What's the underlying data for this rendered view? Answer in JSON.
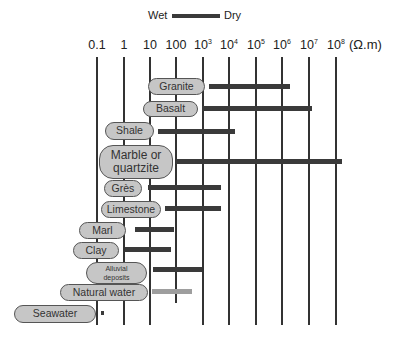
{
  "legend": {
    "wet_label": "Wet",
    "dry_label": "Dry",
    "swatch_color": "#3a3a3a"
  },
  "axis": {
    "unit": "(Ω.m)",
    "ticks": [
      {
        "base": "0.1",
        "exp": "",
        "x": 97
      },
      {
        "base": "1",
        "exp": "",
        "x": 124
      },
      {
        "base": "10",
        "exp": "",
        "x": 150
      },
      {
        "base": "100",
        "exp": "",
        "x": 176
      },
      {
        "base": "10",
        "exp": "3",
        "x": 203
      },
      {
        "base": "10",
        "exp": "4",
        "x": 229
      },
      {
        "base": "10",
        "exp": "5",
        "x": 256
      },
      {
        "base": "10",
        "exp": "6",
        "x": 282
      },
      {
        "base": "10",
        "exp": "7",
        "x": 309
      },
      {
        "base": "10",
        "exp": "8",
        "x": 336
      }
    ]
  },
  "materials": [
    {
      "name": "Granite",
      "line2": ""
    },
    {
      "name": "Basalt",
      "line2": ""
    },
    {
      "name": "Shale",
      "line2": ""
    },
    {
      "name": "Marble or",
      "line2": "quartzite"
    },
    {
      "name": "Grès",
      "line2": ""
    },
    {
      "name": "Limestone",
      "line2": ""
    },
    {
      "name": "Marl",
      "line2": ""
    },
    {
      "name": "Clay",
      "line2": ""
    },
    {
      "name": "Alluvial",
      "line2": "deposits"
    },
    {
      "name": "Natural water",
      "line2": ""
    },
    {
      "name": "Seawater",
      "line2": ""
    }
  ],
  "colors": {
    "bar": "#3a3a3a",
    "water_bar": "#9e9e9e",
    "pill_fill": "#c6c6c6",
    "pill_border": "#555555"
  },
  "chart_data": {
    "type": "bar",
    "subtype": "horizontal range (floating) bars on log scale",
    "title": "",
    "legend": [
      "Wet",
      "Dry"
    ],
    "legend_note": "bar runs from wet (left) to dry (right)",
    "xlabel": "Resistivity (Ω.m)",
    "x_scale": "log10",
    "xlim": [
      0.1,
      100000000
    ],
    "x_ticks": [
      "0.1",
      "1",
      "10",
      "100",
      "10^3",
      "10^4",
      "10^5",
      "10^6",
      "10^7",
      "10^8"
    ],
    "grid": "vertical lines at each decade",
    "categories": [
      "Granite",
      "Basalt",
      "Shale",
      "Marble or quartzite",
      "Grès",
      "Limestone",
      "Marl",
      "Clay",
      "Alluvial deposits",
      "Natural water",
      "Seawater"
    ],
    "ranges": [
      {
        "name": "Granite",
        "min": 3000,
        "max": 1000000
      },
      {
        "name": "Basalt",
        "min": 1000,
        "max": 10000000
      },
      {
        "name": "Shale",
        "min": 20,
        "max": 2000
      },
      {
        "name": "Marble or quartzite",
        "min": 100,
        "max": 200000000
      },
      {
        "name": "Grès",
        "min": 10,
        "max": 800
      },
      {
        "name": "Limestone",
        "min": 50,
        "max": 800
      },
      {
        "name": "Marl",
        "min": 3,
        "max": 70
      },
      {
        "name": "Clay",
        "min": 1,
        "max": 60
      },
      {
        "name": "Alluvial deposits",
        "min": 10,
        "max": 1000
      },
      {
        "name": "Natural water",
        "min": 10,
        "max": 300
      },
      {
        "name": "Seawater",
        "min": 0.15,
        "max": 0.2
      }
    ]
  }
}
